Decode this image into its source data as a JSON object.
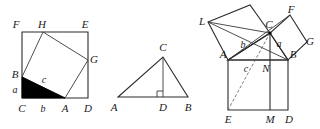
{
  "figure": {
    "background_color": "#ffffff",
    "line_color": "#2b2b2b",
    "fill_color": "#000000"
  },
  "panels": [
    {
      "id": "panel-left",
      "name": "tilted-square-in-square",
      "description": "Outer square FEDC with inscribed tilted square BHGA and shaded right triangle",
      "labels": {
        "F": "F",
        "H": "H",
        "E": "E",
        "G": "G",
        "B": "B",
        "c": "c",
        "a": "a",
        "C": "C",
        "b": "b",
        "A": "A",
        "D": "D"
      },
      "points": {
        "F": [
          22,
          32
        ],
        "E": [
          88,
          32
        ],
        "D": [
          88,
          98
        ],
        "C": [
          22,
          98
        ],
        "H": [
          43,
          32
        ],
        "G": [
          88,
          60
        ],
        "B": [
          22,
          77
        ],
        "A": [
          65,
          98
        ]
      },
      "shaded_triangle": [
        "B",
        "C",
        "A"
      ]
    },
    {
      "id": "panel-middle",
      "name": "triangle-with-altitude",
      "description": "Triangle ABC with altitude CD to base AB and right angle mark at D",
      "labels": {
        "C": "C",
        "A": "A",
        "D": "D",
        "B": "B"
      },
      "points": {
        "A": [
          118,
          97
        ],
        "B": [
          188,
          97
        ],
        "C": [
          163,
          57
        ],
        "D": [
          163,
          97
        ]
      },
      "right_angle_at": "D"
    },
    {
      "id": "panel-right",
      "name": "euclid-windmill",
      "description": "Euclid's windmill: squares on the three sides of right triangle ABC with altitude CMN",
      "labels": {
        "L": "L",
        "C": "C",
        "F": "F",
        "b": "b",
        "a": "a",
        "G": "G",
        "A": "A",
        "B": "B",
        "c": "c",
        "N": "N",
        "E": "E",
        "M": "M",
        "D": "D"
      },
      "points": {
        "A": [
          228,
          60
        ],
        "B": [
          288,
          60
        ],
        "C": [
          270,
          33
        ],
        "E": [
          228,
          110
        ],
        "D": [
          288,
          110
        ],
        "M": [
          270,
          110
        ],
        "N": [
          270,
          60
        ],
        "L": [
          208,
          22
        ],
        "K": [
          250,
          5
        ],
        "F": [
          290,
          15
        ],
        "G": [
          307,
          42
        ]
      }
    }
  ]
}
